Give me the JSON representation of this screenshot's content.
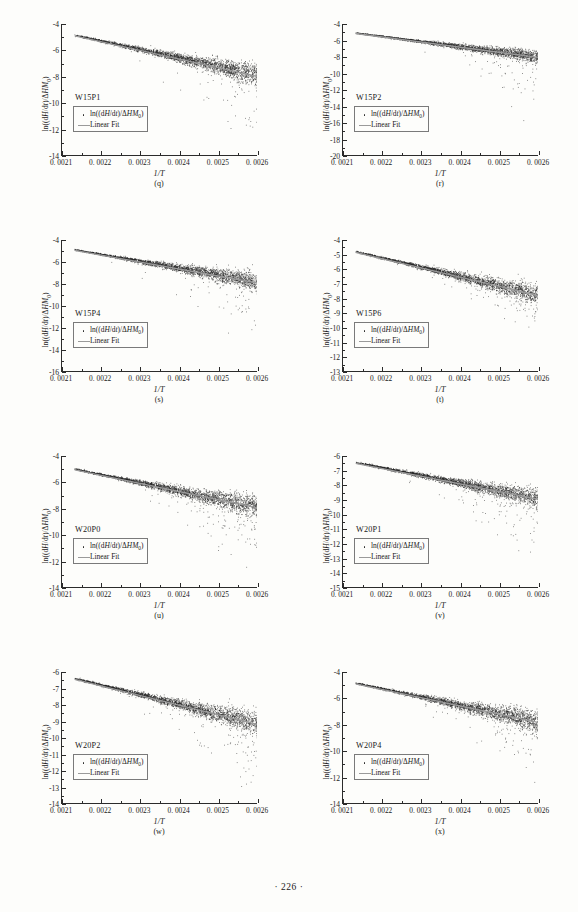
{
  "page": {
    "footer": "· 226 ·"
  },
  "common": {
    "xlabel": "1/T",
    "ylabel": "ln((dH/dt)/ΔHM0)",
    "legend": {
      "scatter_label": "ln((dH/dt)/ΔHM0)",
      "fit_label": "Linear Fit",
      "scatter_marker": "dot-marker-icon",
      "fit_marker": "line-marker-icon"
    },
    "xticks": [
      "0. 0021",
      "0. 0022",
      "0. 0023",
      "0. 0024",
      "0. 0025",
      "0. 0026"
    ],
    "xlim": [
      0.0021,
      0.0026
    ],
    "x_minor_per_major": 2,
    "colors": {
      "scatter": "#232323",
      "fit": "#9a9a9a",
      "axis": "#2b2b2b",
      "page_background": "#fdfdfb"
    }
  },
  "chart_data": [
    {
      "panel": "(q)",
      "type": "scatter",
      "sample": "W15P1",
      "title": "",
      "xlabel": "1/T",
      "ylabel": "ln((dH/dt)/ΔHM0)",
      "xlim": [
        0.0021,
        0.0026
      ],
      "ylim": [
        -14,
        -4
      ],
      "yticks": [
        -4,
        -6,
        -8,
        -10,
        -12,
        -14
      ],
      "ytick_labels": [
        "-4",
        "-6",
        "-8",
        "-10",
        "-12",
        "-14"
      ],
      "y_minor_per_major": 2,
      "grid": false,
      "legend_position": "center-left",
      "series": [
        {
          "name": "ln((dH/dt)/ΔHM0)",
          "kind": "scatter",
          "x_range": [
            0.002135,
            0.002605
          ],
          "y_at_xmin": -4.85,
          "y_at_xmax": -7.9,
          "band_half_width_at_xmin": 0.08,
          "band_half_width_at_xmax": 0.95,
          "outlier_fraction": 0.09,
          "outlier_depth": 5.4,
          "n_points": 2600
        },
        {
          "name": "Linear Fit",
          "kind": "line",
          "x": [
            0.002135,
            0.002605
          ],
          "y": [
            -4.9,
            -8.0
          ]
        }
      ]
    },
    {
      "panel": "(r)",
      "type": "scatter",
      "sample": "W15P2",
      "title": "",
      "xlabel": "1/T",
      "ylabel": "ln((dH/dt)/ΔHM0)",
      "xlim": [
        0.0021,
        0.0026
      ],
      "ylim": [
        -20,
        -4
      ],
      "yticks": [
        -4,
        -6,
        -8,
        -10,
        -12,
        -14,
        -16,
        -18,
        -20
      ],
      "ytick_labels": [
        "-4",
        "-6",
        "-8",
        "-10",
        "-12",
        "-14",
        "-16",
        "-18",
        "-20"
      ],
      "y_minor_per_major": 2,
      "grid": false,
      "legend_position": "center-left",
      "series": [
        {
          "name": "ln((dH/dt)/ΔHM0)",
          "kind": "scatter",
          "x_range": [
            0.002135,
            0.0026
          ],
          "y_at_xmin": -5.1,
          "y_at_xmax": -8.0,
          "band_half_width_at_xmin": 0.07,
          "band_half_width_at_xmax": 0.85,
          "outlier_fraction": 0.07,
          "outlier_depth": 9.0,
          "n_points": 2600
        },
        {
          "name": "Linear Fit",
          "kind": "line",
          "x": [
            0.002135,
            0.0026
          ],
          "y": [
            -5.15,
            -8.05
          ]
        }
      ]
    },
    {
      "panel": "(s)",
      "type": "scatter",
      "sample": "W15P4",
      "title": "",
      "xlabel": "1/T",
      "ylabel": "ln((dH/dt)/ΔHM0)",
      "xlim": [
        0.0021,
        0.0026
      ],
      "ylim": [
        -16,
        -4
      ],
      "yticks": [
        -4,
        -6,
        -8,
        -10,
        -12,
        -14,
        -16
      ],
      "ytick_labels": [
        "-4",
        "-6",
        "-8",
        "-10",
        "-12",
        "-14",
        "-16"
      ],
      "y_minor_per_major": 2,
      "grid": false,
      "legend_position": "center-left",
      "series": [
        {
          "name": "ln((dH/dt)/ΔHM0)",
          "kind": "scatter",
          "x_range": [
            0.002135,
            0.002615
          ],
          "y_at_xmin": -4.9,
          "y_at_xmax": -7.9,
          "band_half_width_at_xmin": 0.07,
          "band_half_width_at_xmax": 1.0,
          "outlier_fraction": 0.08,
          "outlier_depth": 6.5,
          "n_points": 2700
        },
        {
          "name": "Linear Fit",
          "kind": "line",
          "x": [
            0.002135,
            0.002615
          ],
          "y": [
            -4.95,
            -8.0
          ]
        }
      ]
    },
    {
      "panel": "(t)",
      "type": "scatter",
      "sample": "W15P6",
      "title": "",
      "xlabel": "1/T",
      "ylabel": "ln((dH/dt)/ΔHM0)",
      "xlim": [
        0.0021,
        0.0026
      ],
      "ylim": [
        -13,
        -4
      ],
      "yticks": [
        -4,
        -5,
        -6,
        -7,
        -8,
        -9,
        -10,
        -11,
        -12,
        -13
      ],
      "ytick_labels": [
        "-4",
        "-5",
        "-6",
        "-7",
        "-8",
        "-9",
        "-10",
        "-11",
        "-12",
        "-13"
      ],
      "y_minor_per_major": 2,
      "grid": false,
      "legend_position": "center-left",
      "series": [
        {
          "name": "ln((dH/dt)/ΔHM0)",
          "kind": "scatter",
          "x_range": [
            0.002135,
            0.00261
          ],
          "y_at_xmin": -4.8,
          "y_at_xmax": -7.8,
          "band_half_width_at_xmin": 0.07,
          "band_half_width_at_xmax": 0.8,
          "outlier_fraction": 0.07,
          "outlier_depth": 2.6,
          "n_points": 2600
        },
        {
          "name": "Linear Fit",
          "kind": "line",
          "x": [
            0.002135,
            0.00261
          ],
          "y": [
            -4.85,
            -7.85
          ]
        }
      ]
    },
    {
      "panel": "(u)",
      "type": "scatter",
      "sample": "W20P0",
      "title": "",
      "xlabel": "1/T",
      "ylabel": "ln((dH/dt)/ΔHM0)",
      "xlim": [
        0.0021,
        0.0026
      ],
      "ylim": [
        -14,
        -4
      ],
      "yticks": [
        -4,
        -6,
        -8,
        -10,
        -12,
        -14
      ],
      "ytick_labels": [
        "-4",
        "-6",
        "-8",
        "-10",
        "-12",
        "-14"
      ],
      "y_minor_per_major": 2,
      "grid": false,
      "legend_position": "center-left",
      "series": [
        {
          "name": "ln((dH/dt)/ΔHM0)",
          "kind": "scatter",
          "x_range": [
            0.002135,
            0.002605
          ],
          "y_at_xmin": -5.0,
          "y_at_xmax": -7.9,
          "band_half_width_at_xmin": 0.07,
          "band_half_width_at_xmax": 1.0,
          "outlier_fraction": 0.09,
          "outlier_depth": 5.0,
          "n_points": 2700
        },
        {
          "name": "Linear Fit",
          "kind": "line",
          "x": [
            0.002135,
            0.002605
          ],
          "y": [
            -5.05,
            -7.95
          ]
        }
      ]
    },
    {
      "panel": "(v)",
      "type": "scatter",
      "sample": "W20P1",
      "title": "",
      "xlabel": "1/T",
      "ylabel": "ln((dH/dt)/ΔHM0)",
      "xlim": [
        0.0021,
        0.0026
      ],
      "ylim": [
        -15,
        -6
      ],
      "yticks": [
        -6,
        -7,
        -8,
        -9,
        -10,
        -11,
        -12,
        -13,
        -14,
        -15
      ],
      "ytick_labels": [
        "-6",
        "-7",
        "-8",
        "-9",
        "-10",
        "-11",
        "-12",
        "-13",
        "-14",
        "-15"
      ],
      "y_minor_per_major": 2,
      "grid": false,
      "legend_position": "center-left",
      "series": [
        {
          "name": "ln((dH/dt)/ΔHM0)",
          "kind": "scatter",
          "x_range": [
            0.002135,
            0.0026
          ],
          "y_at_xmin": -6.45,
          "y_at_xmax": -8.9,
          "band_half_width_at_xmin": 0.07,
          "band_half_width_at_xmax": 0.75,
          "outlier_fraction": 0.09,
          "outlier_depth": 5.0,
          "n_points": 2600
        },
        {
          "name": "Linear Fit",
          "kind": "line",
          "x": [
            0.002135,
            0.0026
          ],
          "y": [
            -6.5,
            -8.95
          ]
        }
      ]
    },
    {
      "panel": "(w)",
      "type": "scatter",
      "sample": "W20P2",
      "title": "",
      "xlabel": "1/T",
      "ylabel": "ln((dH/dt)/ΔHM0)",
      "xlim": [
        0.0021,
        0.0026
      ],
      "ylim": [
        -14,
        -6
      ],
      "yticks": [
        -6,
        -7,
        -8,
        -9,
        -10,
        -11,
        -12,
        -13,
        -14
      ],
      "ytick_labels": [
        "-6",
        "-7",
        "-8",
        "-9",
        "-10",
        "-11",
        "-12",
        "-13",
        "-14"
      ],
      "y_minor_per_major": 2,
      "grid": false,
      "legend_position": "center-left",
      "series": [
        {
          "name": "ln((dH/dt)/ΔHM0)",
          "kind": "scatter",
          "x_range": [
            0.002135,
            0.002605
          ],
          "y_at_xmin": -6.4,
          "y_at_xmax": -9.15,
          "band_half_width_at_xmin": 0.07,
          "band_half_width_at_xmax": 0.8,
          "outlier_fraction": 0.09,
          "outlier_depth": 4.6,
          "n_points": 2700
        },
        {
          "name": "Linear Fit",
          "kind": "line",
          "x": [
            0.002135,
            0.002605
          ],
          "y": [
            -6.45,
            -9.2
          ]
        }
      ]
    },
    {
      "panel": "(x)",
      "type": "scatter",
      "sample": "W20P4",
      "title": "",
      "xlabel": "1/T",
      "ylabel": "ln((dH/dt)/ΔHM0)",
      "xlim": [
        0.0021,
        0.0026
      ],
      "ylim": [
        -14,
        -4
      ],
      "yticks": [
        -4,
        -6,
        -8,
        -10,
        -12,
        -14
      ],
      "ytick_labels": [
        "-4",
        "-6",
        "-8",
        "-10",
        "-12",
        "-14"
      ],
      "y_minor_per_major": 2,
      "grid": false,
      "legend_position": "center-left",
      "series": [
        {
          "name": "ln((dH/dt)/ΔHM0)",
          "kind": "scatter",
          "x_range": [
            0.002135,
            0.002605
          ],
          "y_at_xmin": -4.85,
          "y_at_xmax": -7.8,
          "band_half_width_at_xmin": 0.07,
          "band_half_width_at_xmax": 0.95,
          "outlier_fraction": 0.09,
          "outlier_depth": 5.2,
          "n_points": 2700
        },
        {
          "name": "Linear Fit",
          "kind": "line",
          "x": [
            0.002135,
            0.002605
          ],
          "y": [
            -4.9,
            -7.85
          ]
        }
      ]
    }
  ]
}
